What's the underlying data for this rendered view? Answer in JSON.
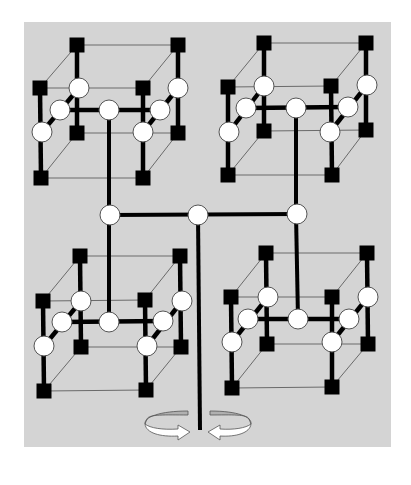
{
  "diagram": {
    "title": "",
    "colors": {
      "background": "#ffffff",
      "panel": "#d4d4d4",
      "square_node": "#000000",
      "circle_node": "#ffffff",
      "thick_link": "#000000",
      "thin_link": "#6a6a6a",
      "arrow_fill": "#ffffff",
      "arrow_back": "#b0b0b0"
    },
    "panel": {
      "x": 24,
      "y": 22,
      "width": 367,
      "height": 425
    },
    "square_size": 15,
    "circle_radius": 10,
    "clusters": [
      {
        "id": "top-left",
        "squares": {
          "back_top_left": [
            77,
            45
          ],
          "back_top_right": [
            178,
            45
          ],
          "back_bot_left": [
            77,
            133
          ],
          "back_bot_right": [
            178,
            133
          ],
          "front_top_left": [
            40,
            88
          ],
          "front_top_right": [
            143,
            88
          ],
          "front_bot_left": [
            41,
            178
          ],
          "front_bot_right": [
            143,
            178
          ]
        },
        "circles": {
          "left_back": [
            79,
            88
          ],
          "left_mid": [
            60,
            110
          ],
          "left_front": [
            42,
            132
          ],
          "right_back": [
            178,
            88
          ],
          "right_mid": [
            160,
            110
          ],
          "right_front": [
            143,
            132
          ],
          "center": [
            109,
            110
          ]
        }
      },
      {
        "id": "top-right",
        "squares": {
          "back_top_left": [
            264,
            43
          ],
          "back_top_right": [
            366,
            43
          ],
          "back_bot_left": [
            264,
            131
          ],
          "back_bot_right": [
            366,
            130
          ],
          "front_top_left": [
            228,
            87
          ],
          "front_top_right": [
            331,
            86
          ],
          "front_bot_left": [
            228,
            175
          ],
          "front_bot_right": [
            332,
            175
          ]
        },
        "circles": {
          "left_back": [
            264,
            86
          ],
          "left_mid": [
            246,
            108
          ],
          "left_front": [
            229,
            132
          ],
          "right_back": [
            367,
            85
          ],
          "right_mid": [
            348,
            107
          ],
          "right_front": [
            330,
            132
          ],
          "center": [
            296,
            108
          ]
        }
      },
      {
        "id": "bottom-left",
        "squares": {
          "back_top_left": [
            80,
            256
          ],
          "back_top_right": [
            180,
            256
          ],
          "back_bot_left": [
            81,
            347
          ],
          "back_bot_right": [
            181,
            347
          ],
          "front_top_left": [
            43,
            301
          ],
          "front_top_right": [
            145,
            300
          ],
          "front_bot_left": [
            44,
            391
          ],
          "front_bot_right": [
            146,
            390
          ]
        },
        "circles": {
          "left_back": [
            81,
            301
          ],
          "left_mid": [
            62,
            322
          ],
          "left_front": [
            44,
            346
          ],
          "right_back": [
            182,
            301
          ],
          "right_mid": [
            163,
            321
          ],
          "right_front": [
            147,
            346
          ],
          "center": [
            109,
            322
          ]
        }
      },
      {
        "id": "bottom-right",
        "squares": {
          "back_top_left": [
            266,
            253
          ],
          "back_top_right": [
            367,
            253
          ],
          "back_bot_left": [
            267,
            344
          ],
          "back_bot_right": [
            368,
            344
          ],
          "front_top_left": [
            231,
            297
          ],
          "front_top_right": [
            332,
            297
          ],
          "front_bot_left": [
            232,
            388
          ],
          "front_bot_right": [
            332,
            387
          ]
        },
        "circles": {
          "left_back": [
            268,
            297
          ],
          "left_mid": [
            248,
            319
          ],
          "left_front": [
            232,
            342
          ],
          "right_back": [
            368,
            297
          ],
          "right_mid": [
            349,
            319
          ],
          "right_front": [
            332,
            342
          ],
          "center": [
            298,
            319
          ]
        }
      }
    ],
    "trunk": {
      "hub_circles": {
        "left": [
          110,
          215
        ],
        "center": [
          198,
          215
        ],
        "right": [
          297,
          214
        ]
      },
      "root_bottom": [
        200,
        430
      ]
    },
    "rotation_arrows": [
      {
        "id": "left-arrow",
        "direction": "clockwise-into-center",
        "span": [
          145,
          405,
          190,
          440
        ]
      },
      {
        "id": "right-arrow",
        "direction": "counterclockwise-into-center",
        "span": [
          208,
          405,
          252,
          440
        ]
      }
    ]
  }
}
